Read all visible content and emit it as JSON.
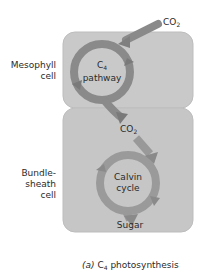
{
  "diagram": {
    "caption_prefix": "(a)",
    "caption_main": "C",
    "caption_sub": "4",
    "caption_rest": " photosynthesis",
    "cells": {
      "mesophyll": {
        "label_line1": "Mesophyll",
        "label_line2": "cell"
      },
      "bundle_sheath": {
        "label_line1": "Bundle-",
        "label_line2": "sheath",
        "label_line3": "cell"
      }
    },
    "cycles": {
      "c4": {
        "line1_main": "C",
        "line1_sub": "4",
        "line2": "pathway"
      },
      "calvin": {
        "line1": "Calvin",
        "line2": "cycle"
      }
    },
    "inputs": {
      "co2_top_main": "CO",
      "co2_top_sub": "2",
      "co2_mid_main": "CO",
      "co2_mid_sub": "2"
    },
    "output": {
      "sugar": "Sugar"
    },
    "colors": {
      "cell_fill": "#c9c9c9",
      "cell_stroke": "#b5b5b5",
      "arrow": "#8a8a8a",
      "arrow_dark": "#777777",
      "text": "#2a2a2a"
    }
  }
}
